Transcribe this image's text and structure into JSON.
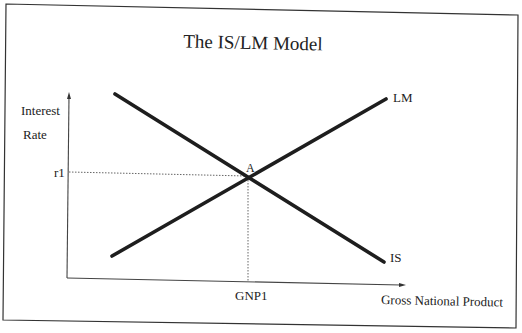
{
  "diagram": {
    "title": "The IS/LM Model",
    "y_axis_label_line1": "Interest",
    "y_axis_label_line2": "Rate",
    "x_axis_label": "Gross National Product",
    "y_tick_label": "r1",
    "x_tick_label": "GNP1",
    "equilibrium_label": "A",
    "curves": [
      {
        "name": "LM",
        "label": "LM",
        "slope": "upward"
      },
      {
        "name": "IS",
        "label": "IS",
        "slope": "downward"
      }
    ],
    "colors": {
      "line": "#1e1e1e",
      "frame": "#333333",
      "guide": "#555555",
      "background": "#ffffff"
    }
  }
}
